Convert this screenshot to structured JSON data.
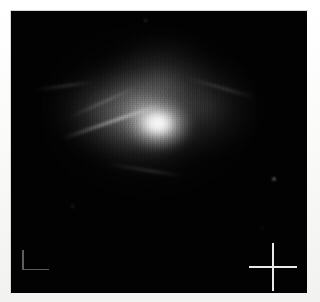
{
  "canvas": {
    "width": 320,
    "height": 302,
    "background_color": "#f7f7f6"
  },
  "image_frame": {
    "label": "astronomical-image",
    "x": 11,
    "y": 11,
    "width": 296,
    "height": 282,
    "background_color": "#000000",
    "border_color": "#d8d8d6",
    "colormap": "grayscale"
  },
  "subject": {
    "name": "diffuse-nebula",
    "description": "Diffuse mottled emission nebula with a bright irregular core and filamentary streamers",
    "core": {
      "center_x": 152,
      "center_y": 122,
      "peak_color": "#ffffff"
    },
    "halo": {
      "center_x": 148,
      "center_y": 112,
      "extent_x": 230,
      "extent_y": 185,
      "color": "#bebebe"
    },
    "filaments": [
      {
        "name": "filament-northwest",
        "angle_deg": -19,
        "length": 104
      },
      {
        "name": "filament-northwest-secondary",
        "angle_deg": -24,
        "length": 72
      },
      {
        "name": "filament-west",
        "angle_deg": -8,
        "length": 58
      },
      {
        "name": "filament-northeast",
        "angle_deg": 16,
        "length": 70
      },
      {
        "name": "filament-south",
        "angle_deg": 9,
        "length": 76
      }
    ],
    "texture": "vertical detector striping / scan-line artifacts"
  },
  "markers": {
    "corner_marker": {
      "name": "corner-scale-marker",
      "shape": "L",
      "x": 11,
      "y": 239,
      "width": 27,
      "height": 20,
      "color": "#5d5d5d"
    },
    "crosshair_marker": {
      "name": "crosshair-marker",
      "shape": "cross",
      "center_x": 262,
      "center_y": 256,
      "size": 48,
      "color": "#e9e9e9"
    }
  },
  "point_sources": [
    {
      "name": "point-source-1",
      "x": 261,
      "y": 166
    },
    {
      "name": "point-source-2",
      "x": 133,
      "y": 8
    },
    {
      "name": "point-source-3",
      "x": 60,
      "y": 194
    },
    {
      "name": "point-source-4",
      "x": 250,
      "y": 216
    }
  ],
  "accessibility": {
    "image_alt": "Grayscale astronomical image of a diffuse nebula with bright core, filamentary structure, an L-shaped corner marker at lower left and a crosshair marker at lower right."
  }
}
